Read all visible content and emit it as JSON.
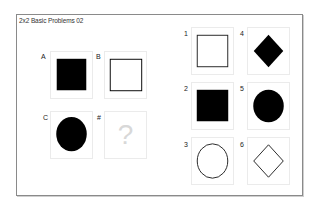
{
  "title": "2x2 Basic Problems 02",
  "matrix": {
    "cells": [
      {
        "label": "A",
        "shape": "square",
        "fill": "black"
      },
      {
        "label": "B",
        "shape": "square",
        "fill": "white"
      },
      {
        "label": "C",
        "shape": "circle",
        "fill": "black"
      },
      {
        "label": "#",
        "shape": "unknown",
        "placeholder": "?"
      }
    ]
  },
  "answers": {
    "options": [
      {
        "label": "1",
        "shape": "square",
        "fill": "white"
      },
      {
        "label": "2",
        "shape": "square",
        "fill": "black"
      },
      {
        "label": "3",
        "shape": "circle",
        "fill": "white"
      },
      {
        "label": "4",
        "shape": "diamond",
        "fill": "black"
      },
      {
        "label": "5",
        "shape": "circle",
        "fill": "black"
      },
      {
        "label": "6",
        "shape": "diamond",
        "fill": "white"
      }
    ]
  },
  "colors": {
    "frame": "#8a8a8a",
    "cell_border": "#ebebeb",
    "shape": "#000000",
    "placeholder": "#d8d8d8"
  }
}
